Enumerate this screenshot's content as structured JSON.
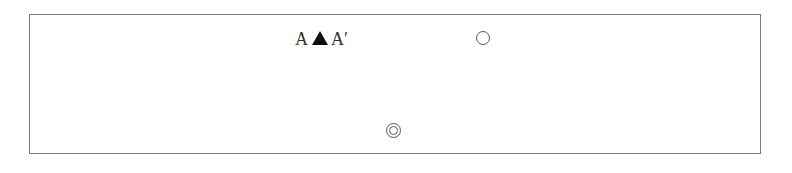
{
  "diagram": {
    "label": {
      "left_letter": "A",
      "middle_symbol": "filled-triangle",
      "right_letter": "A′"
    },
    "symbols": [
      {
        "name": "open-circle",
        "description": "single circle"
      },
      {
        "name": "double-circle",
        "description": "concentric circle"
      }
    ],
    "colors": {
      "frame_border": "#7a7a7a",
      "text": "#333333",
      "triangle_fill": "#111111",
      "circle_stroke": "#555555"
    }
  }
}
